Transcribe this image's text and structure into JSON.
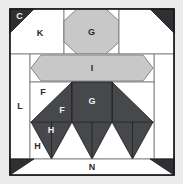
{
  "diagram": {
    "type": "quilt-block",
    "canvas": {
      "width": 183,
      "height": 184
    },
    "background_color": "#ebebeb",
    "colors": {
      "background": "#ebebeb",
      "white_fabric": "#ffffff",
      "light_gray_fabric": "#c8c8c8",
      "dark_gray_fabric": "#46484c",
      "outline": "#1a1a1a",
      "seam_line": "#888888",
      "label_on_dark": "#f2f2f2",
      "label_on_light": "#2b2b2b"
    },
    "labels": {
      "corner_top_left": "C",
      "top_left_rect": "K",
      "top_center_octagon": "G",
      "center_band": "I",
      "left_strip": "L",
      "flying_geese_left": "F",
      "flying_geese_inner": "F",
      "center_square": "G",
      "small_triangle_upper": "H",
      "small_triangle_lower": "H",
      "bottom_strip": "N"
    },
    "pieces": [
      {
        "id": "frame",
        "name": "outer-frame",
        "fabric": "white",
        "label": ""
      },
      {
        "id": "corner-tl",
        "name": "corner-triangle-top-left",
        "fabric": "dark",
        "label": "C"
      },
      {
        "id": "corner-tr",
        "name": "corner-triangle-top-right",
        "fabric": "dark",
        "label": ""
      },
      {
        "id": "corner-bl",
        "name": "corner-triangle-bottom-left",
        "fabric": "dark",
        "label": ""
      },
      {
        "id": "corner-br",
        "name": "corner-triangle-bottom-right",
        "fabric": "dark",
        "label": ""
      },
      {
        "id": "rect-k",
        "name": "rectangle-k",
        "fabric": "white",
        "label": "K"
      },
      {
        "id": "oct-g-top",
        "name": "octagon-g-top",
        "fabric": "light",
        "label": "G"
      },
      {
        "id": "band-i",
        "name": "elongated-hexagon-i",
        "fabric": "light",
        "label": "I"
      },
      {
        "id": "strip-l",
        "name": "side-strip-l",
        "fabric": "white",
        "label": "L"
      },
      {
        "id": "strip-right",
        "name": "side-strip-right",
        "fabric": "white",
        "label": ""
      },
      {
        "id": "goose-f-left",
        "name": "flying-geese-f-left",
        "fabric": "dark",
        "label": "F"
      },
      {
        "id": "goose-f-inner",
        "name": "flying-geese-f-inner",
        "fabric": "dark",
        "label": "F"
      },
      {
        "id": "square-g",
        "name": "center-square-g",
        "fabric": "dark",
        "label": "G"
      },
      {
        "id": "goose-right",
        "name": "flying-geese-right",
        "fabric": "dark",
        "label": ""
      },
      {
        "id": "tri-h-1",
        "name": "half-square-triangle-h-1",
        "fabric": "dark",
        "label": "H"
      },
      {
        "id": "tri-h-2",
        "name": "half-square-triangle-h-2",
        "fabric": "dark",
        "label": "H"
      },
      {
        "id": "tri-h-3",
        "name": "half-square-triangle-h-3",
        "fabric": "dark",
        "label": ""
      },
      {
        "id": "tri-h-4",
        "name": "half-square-triangle-h-4",
        "fabric": "dark",
        "label": ""
      },
      {
        "id": "strip-n",
        "name": "bottom-strip-n",
        "fabric": "white",
        "label": "N"
      }
    ]
  }
}
